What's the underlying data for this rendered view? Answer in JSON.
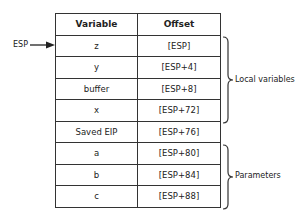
{
  "table": {
    "headers": [
      "Variable",
      "Offset"
    ],
    "rows": [
      {
        "variable": "z",
        "offset": "[ESP]"
      },
      {
        "variable": "y",
        "offset": "[ESP+4]"
      },
      {
        "variable": "buffer",
        "offset": "[ESP+8]"
      },
      {
        "variable": "x",
        "offset": "[ESP+72]"
      },
      {
        "variable": "Saved EIP",
        "offset": "[ESP+76]"
      },
      {
        "variable": "a",
        "offset": "[ESP+80]"
      },
      {
        "variable": "b",
        "offset": "[ESP+84]"
      },
      {
        "variable": "c",
        "offset": "[ESP+88]"
      }
    ]
  },
  "pointer": {
    "label": "ESP"
  },
  "groups": {
    "local": "Local variables",
    "params": "Parameters"
  }
}
